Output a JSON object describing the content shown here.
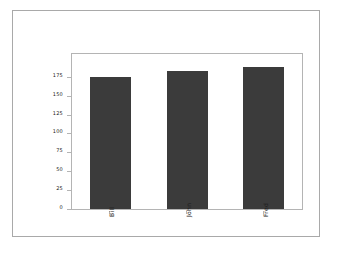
{
  "chart_data": {
    "type": "bar",
    "title": "",
    "subtitle": "",
    "xlabel": "",
    "ylabel": "",
    "categories": [
      "Bill",
      "John",
      "Fred"
    ],
    "values": [
      175,
      182,
      188
    ],
    "series": [
      {
        "name": "",
        "values": [
          175,
          182,
          188
        ]
      }
    ],
    "ylim": [
      0,
      205
    ],
    "yticks": [
      0,
      25,
      50,
      75,
      100,
      125,
      150,
      175
    ],
    "ytick_labels": [
      "0",
      "25",
      "50",
      "75",
      "100",
      "125",
      "150",
      "175"
    ],
    "grid": false,
    "legend": false,
    "legend_position": "none",
    "bar_color": "#3b3b3b",
    "plot_frame_color": "#b4b4b4",
    "figure_border_color": "#a9a9a9",
    "background_color": "#ffffff",
    "xtick_label_rotation": "90"
  }
}
